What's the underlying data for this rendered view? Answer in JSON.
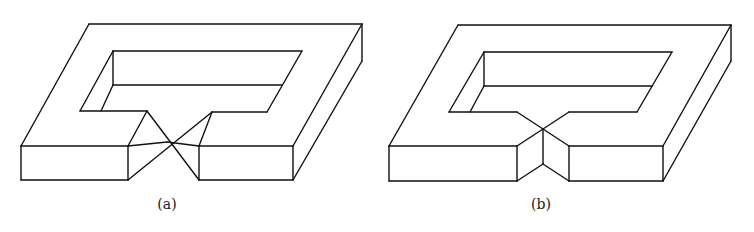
{
  "figure": {
    "panels": [
      {
        "id": "a",
        "caption": "(a)",
        "caption_x": 137,
        "notch_style": "twisted bowtie: faces converge to a single crossing point at the top edge",
        "lines": [
          [
            [
              89,
              24
            ],
            [
              362,
              24
            ]
          ],
          [
            [
              362,
              24
            ],
            [
              362,
              61
            ]
          ],
          [
            [
              89,
              24
            ],
            [
              21,
              146
            ]
          ],
          [
            [
              362,
              24
            ],
            [
              293,
              146
            ]
          ],
          [
            [
              362,
              61
            ],
            [
              293,
              180
            ]
          ],
          [
            [
              21,
              146
            ],
            [
              128,
              146
            ]
          ],
          [
            [
              21,
              146
            ],
            [
              21,
              180
            ]
          ],
          [
            [
              21,
              180
            ],
            [
              128,
              180
            ]
          ],
          [
            [
              128,
              146
            ],
            [
              128,
              180
            ]
          ],
          [
            [
              199,
              146
            ],
            [
              293,
              146
            ]
          ],
          [
            [
              293,
              146
            ],
            [
              293,
              180
            ]
          ],
          [
            [
              199,
              180
            ],
            [
              293,
              180
            ]
          ],
          [
            [
              199,
              146
            ],
            [
              199,
              180
            ]
          ],
          [
            [
              113,
              51
            ],
            [
              302,
              51
            ]
          ],
          [
            [
              113,
              51
            ],
            [
              80,
              111
            ]
          ],
          [
            [
              113,
              51
            ],
            [
              113,
              85
            ]
          ],
          [
            [
              113,
              85
            ],
            [
              282,
              85
            ]
          ],
          [
            [
              302,
              51
            ],
            [
              267,
              112
            ]
          ],
          [
            [
              113,
              85
            ],
            [
              101,
              111
            ]
          ],
          [
            [
              80,
              111
            ],
            [
              147,
              111
            ]
          ],
          [
            [
              212,
              112
            ],
            [
              267,
              112
            ]
          ],
          [
            [
              147,
              111
            ],
            [
              128,
              146
            ]
          ],
          [
            [
              147,
              111
            ],
            [
              199,
              180
            ]
          ],
          [
            [
              212,
              112
            ],
            [
              199,
              146
            ]
          ],
          [
            [
              212,
              112
            ],
            [
              128,
              180
            ]
          ],
          [
            [
              128,
              146
            ],
            [
              167,
              142
            ]
          ],
          [
            [
              167,
              142
            ],
            [
              199,
              146
            ]
          ]
        ]
      },
      {
        "id": "b",
        "caption": "(b)",
        "caption_x": 511,
        "notch_style": "V-notch: inner edges meet at a point with a vertical crease down the front",
        "lines": [
          [
            [
              458,
              25
            ],
            [
              731,
              25
            ]
          ],
          [
            [
              731,
              25
            ],
            [
              731,
              61
            ]
          ],
          [
            [
              458,
              25
            ],
            [
              389,
              146
            ]
          ],
          [
            [
              731,
              25
            ],
            [
              663,
              146
            ]
          ],
          [
            [
              731,
              61
            ],
            [
              663,
              181
            ]
          ],
          [
            [
              389,
              146
            ],
            [
              517,
              146
            ]
          ],
          [
            [
              389,
              146
            ],
            [
              389,
              181
            ]
          ],
          [
            [
              389,
              181
            ],
            [
              517,
              181
            ]
          ],
          [
            [
              517,
              146
            ],
            [
              517,
              181
            ]
          ],
          [
            [
              569,
              146
            ],
            [
              663,
              146
            ]
          ],
          [
            [
              663,
              146
            ],
            [
              663,
              181
            ]
          ],
          [
            [
              569,
              181
            ],
            [
              663,
              181
            ]
          ],
          [
            [
              569,
              146
            ],
            [
              569,
              181
            ]
          ],
          [
            [
              484,
              52
            ],
            [
              672,
              52
            ]
          ],
          [
            [
              484,
              52
            ],
            [
              449,
              112
            ]
          ],
          [
            [
              484,
              52
            ],
            [
              484,
              86
            ]
          ],
          [
            [
              484,
              86
            ],
            [
              652,
              86
            ]
          ],
          [
            [
              672,
              52
            ],
            [
              637,
              112
            ]
          ],
          [
            [
              484,
              86
            ],
            [
              470,
              112
            ]
          ],
          [
            [
              449,
              112
            ],
            [
              517,
              112
            ]
          ],
          [
            [
              569,
              112
            ],
            [
              637,
              112
            ]
          ],
          [
            [
              517,
              112
            ],
            [
              543,
              129
            ]
          ],
          [
            [
              569,
              112
            ],
            [
              543,
              129
            ]
          ],
          [
            [
              543,
              129
            ],
            [
              517,
              146
            ]
          ],
          [
            [
              543,
              129
            ],
            [
              569,
              146
            ]
          ],
          [
            [
              543,
              129
            ],
            [
              543,
              164
            ]
          ],
          [
            [
              543,
              164
            ],
            [
              517,
              181
            ]
          ],
          [
            [
              543,
              164
            ],
            [
              569,
              181
            ]
          ]
        ]
      }
    ]
  }
}
